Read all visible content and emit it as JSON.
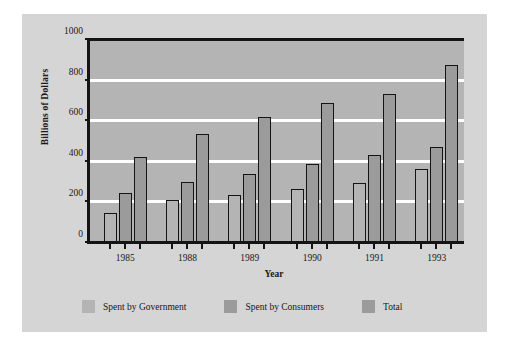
{
  "chart_data": {
    "type": "bar",
    "title": "",
    "xlabel": "Year",
    "ylabel": "Billions of Dollars",
    "categories": [
      "1985",
      "1988",
      "1989",
      "1990",
      "1991",
      "1993"
    ],
    "series": [
      {
        "name": "Spent by Government",
        "values": [
          155,
          215,
          240,
          270,
          300,
          370
        ],
        "color": "#b4b4b4"
      },
      {
        "name": "Spent by Consumers",
        "values": [
          250,
          305,
          345,
          395,
          440,
          480
        ],
        "color": "#9b9b9b"
      },
      {
        "name": "Total",
        "values": [
          430,
          540,
          625,
          695,
          740,
          880
        ],
        "color": "#9b9b9b"
      }
    ],
    "ylim": [
      0,
      1000
    ],
    "yticks": [
      0,
      200,
      400,
      600,
      800,
      1000
    ],
    "ytick_labels": [
      "0",
      "200",
      "400",
      "600",
      "800",
      "1000"
    ],
    "grid": true,
    "gridline_color": "#ffffff",
    "plot_background": "#b4b4b4",
    "figure_background": "#d5d5d5",
    "axis_color": "#141414",
    "legend_position": "bottom"
  }
}
